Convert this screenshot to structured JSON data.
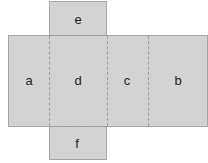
{
  "diagram": {
    "type": "cube-net",
    "faces": [
      {
        "id": "a",
        "label": "a"
      },
      {
        "id": "d",
        "label": "d"
      },
      {
        "id": "c",
        "label": "c"
      },
      {
        "id": "b",
        "label": "b"
      },
      {
        "id": "e",
        "label": "e"
      },
      {
        "id": "f",
        "label": "f"
      }
    ],
    "colors": {
      "fill": "#d3d3d3",
      "border": "#a6a6a6",
      "fold_line": "#9a9a9a",
      "text": "#1e1e1e"
    }
  }
}
